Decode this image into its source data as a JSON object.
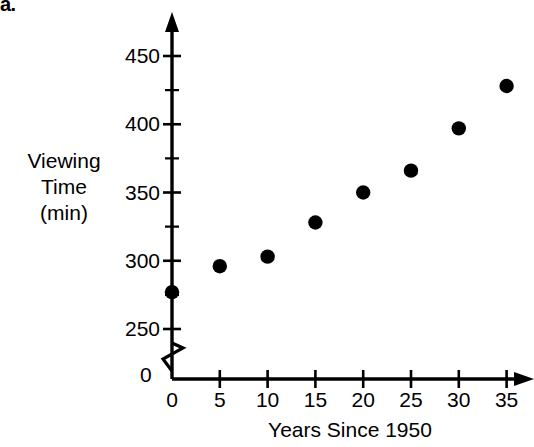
{
  "part_label": "a.",
  "chart_data": {
    "type": "scatter",
    "title": "",
    "xlabel": "Years Since 1950",
    "ylabel": "Viewing Time (min)",
    "ylabel_lines": [
      "Viewing",
      "Time",
      "(min)"
    ],
    "x": [
      0,
      5,
      10,
      15,
      20,
      25,
      30,
      35
    ],
    "values": [
      277,
      296,
      303,
      328,
      350,
      366,
      397,
      428
    ],
    "points": [
      {
        "x": 0,
        "y": 277
      },
      {
        "x": 5,
        "y": 296
      },
      {
        "x": 10,
        "y": 303
      },
      {
        "x": 15,
        "y": 328
      },
      {
        "x": 20,
        "y": 350
      },
      {
        "x": 25,
        "y": 366
      },
      {
        "x": 30,
        "y": 397
      },
      {
        "x": 35,
        "y": 428
      }
    ],
    "xlim": [
      0,
      37
    ],
    "ylim": [
      250,
      465
    ],
    "xticks": [
      0,
      5,
      10,
      15,
      20,
      25,
      30,
      35
    ],
    "xtick_labels": [
      "0",
      "5",
      "10",
      "15",
      "20",
      "25",
      "30",
      "35"
    ],
    "yticks": [
      250,
      300,
      350,
      400,
      450
    ],
    "ytick_labels": [
      "250",
      "300",
      "350",
      "400",
      "450"
    ],
    "y_minor_ticks": [
      275,
      325,
      375,
      425
    ],
    "origin_label": "0",
    "axis_break": true,
    "grid": false,
    "legend": null,
    "marker": "filled-circle",
    "marker_color": "#000000"
  }
}
